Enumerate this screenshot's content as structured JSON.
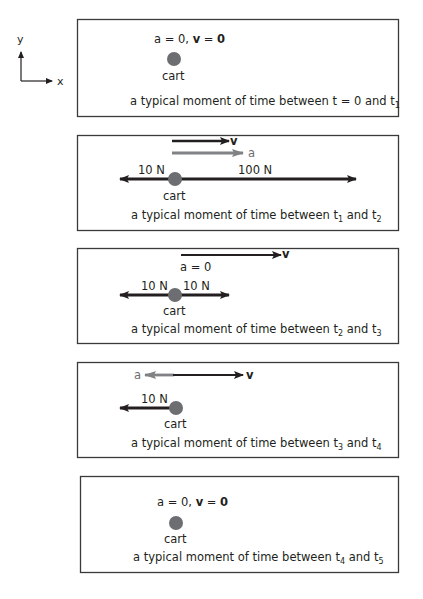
{
  "axes": {
    "x_label": "x",
    "y_label": "y"
  },
  "colors": {
    "ink": "#231f20",
    "vector_grey": "#808285",
    "cart": "#6d6e71",
    "box_border": "#3a3a3a"
  },
  "cart_label": "cart",
  "panels": [
    {
      "state_a": "a = 0, ",
      "state_v_sym": "v",
      "state_v_val": " = ",
      "state_zero": "0",
      "caption_prefix": "a typical moment of time between t = 0 and t",
      "caption_sub1": "1"
    },
    {
      "v_label": "v",
      "a_label": "a",
      "force_left": "10 N",
      "force_right": "100 N",
      "caption_prefix": "a typical moment of time between t",
      "caption_sub1": "1",
      "caption_mid": " and t",
      "caption_sub2": "2"
    },
    {
      "v_label": "v",
      "a_text": "a = 0",
      "force_left": "10 N",
      "force_right": "10 N",
      "caption_prefix": "a typical moment of time between t",
      "caption_sub1": "2",
      "caption_mid": " and t",
      "caption_sub2": "3"
    },
    {
      "a_label": "a",
      "v_label": "v",
      "force_left": "10 N",
      "caption_prefix": "a typical moment of time between t",
      "caption_sub1": "3",
      "caption_mid": " and t",
      "caption_sub2": "4"
    },
    {
      "state_a": "a = 0, ",
      "state_v_sym": "v",
      "state_v_val": " = ",
      "state_zero": "0",
      "caption_prefix": "a typical moment of time between t",
      "caption_sub1": "4",
      "caption_mid": " and t",
      "caption_sub2": "5"
    }
  ]
}
